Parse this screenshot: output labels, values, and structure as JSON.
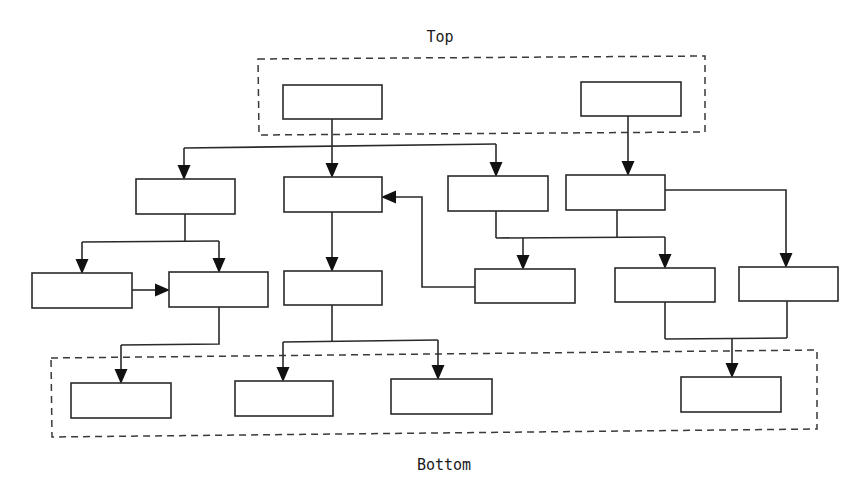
{
  "diagram": {
    "labels": {
      "top": {
        "text": "Top",
        "x": 440,
        "y": 42
      },
      "bottom": {
        "text": "Bottom",
        "x": 444,
        "y": 470
      }
    },
    "colors": {
      "stroke": "#2a2a2a",
      "background": "#ffffff",
      "arrow": "#111111"
    },
    "groups": [
      {
        "id": "top-group",
        "points": "258,59 705,56 705,132 259,135"
      },
      {
        "id": "bottom-group",
        "points": "51,358 817,350 817,429 52,437"
      }
    ],
    "nodes": [
      {
        "id": "top-1",
        "x": 283,
        "y": 85,
        "w": 99,
        "h": 34
      },
      {
        "id": "top-2",
        "x": 581,
        "y": 82,
        "w": 100,
        "h": 34
      },
      {
        "id": "a",
        "x": 136,
        "y": 179,
        "w": 99,
        "h": 35
      },
      {
        "id": "b",
        "x": 284,
        "y": 177,
        "w": 98,
        "h": 35
      },
      {
        "id": "c",
        "x": 448,
        "y": 176,
        "w": 100,
        "h": 35
      },
      {
        "id": "d",
        "x": 566,
        "y": 175,
        "w": 99,
        "h": 35
      },
      {
        "id": "e",
        "x": 32,
        "y": 273,
        "w": 100,
        "h": 35
      },
      {
        "id": "f",
        "x": 169,
        "y": 272,
        "w": 99,
        "h": 35
      },
      {
        "id": "g",
        "x": 284,
        "y": 271,
        "w": 98,
        "h": 34
      },
      {
        "id": "h",
        "x": 475,
        "y": 269,
        "w": 100,
        "h": 34
      },
      {
        "id": "i",
        "x": 615,
        "y": 268,
        "w": 100,
        "h": 34
      },
      {
        "id": "j",
        "x": 739,
        "y": 267,
        "w": 99,
        "h": 34
      },
      {
        "id": "k",
        "x": 71,
        "y": 383,
        "w": 100,
        "h": 35
      },
      {
        "id": "l",
        "x": 235,
        "y": 381,
        "w": 98,
        "h": 35
      },
      {
        "id": "m",
        "x": 391,
        "y": 379,
        "w": 101,
        "h": 35
      },
      {
        "id": "n",
        "x": 681,
        "y": 377,
        "w": 100,
        "h": 35
      }
    ],
    "edges": [
      {
        "id": "top1-trunk",
        "points": "332,119 332,146"
      },
      {
        "id": "top1-branch",
        "points": "184,148 496,144"
      },
      {
        "id": "top1-to-a",
        "points": "184,148 184,165",
        "arrow": true
      },
      {
        "id": "top1-to-b",
        "points": "332,146 332,163",
        "arrow": true
      },
      {
        "id": "top1-to-c",
        "points": "496,144 496,162",
        "arrow": true
      },
      {
        "id": "top2-to-d",
        "points": "628,116 628,161",
        "arrow": true
      },
      {
        "id": "a-trunk",
        "points": "185,214 185,241"
      },
      {
        "id": "a-branch",
        "points": "82,242 219,241"
      },
      {
        "id": "a-to-e",
        "points": "82,242 82,259",
        "arrow": true
      },
      {
        "id": "a-to-f",
        "points": "219,241 219,258",
        "arrow": true
      },
      {
        "id": "e-to-f",
        "points": "132,290 155,290",
        "arrow": true
      },
      {
        "id": "b-to-g",
        "points": "332,212 332,257",
        "arrow": true
      },
      {
        "id": "h-to-b",
        "points": "475,287 422,287 422,197 396,197",
        "arrow": true
      },
      {
        "id": "c-stem",
        "points": "496,211 496,238"
      },
      {
        "id": "d-stem",
        "points": "617,210 617,238"
      },
      {
        "id": "cd-branch",
        "points": "496,238 665,237"
      },
      {
        "id": "cd-to-h",
        "points": "523,238 523,255",
        "arrow": true
      },
      {
        "id": "cd-to-i",
        "points": "665,237 665,254",
        "arrow": true
      },
      {
        "id": "d-to-j",
        "points": "665,190 786,190 786,253",
        "arrow": true
      },
      {
        "id": "f-stem",
        "points": "219,307 219,344 121,345"
      },
      {
        "id": "f-to-k",
        "points": "121,345 121,369",
        "arrow": true
      },
      {
        "id": "g-stem",
        "points": "332,305 332,341"
      },
      {
        "id": "g-branch",
        "points": "283,342 438,340"
      },
      {
        "id": "g-to-l",
        "points": "283,342 283,367",
        "arrow": true
      },
      {
        "id": "g-to-m",
        "points": "438,340 438,365",
        "arrow": true
      },
      {
        "id": "i-stem",
        "points": "665,302 665,339"
      },
      {
        "id": "j-stem",
        "points": "787,301 787,338"
      },
      {
        "id": "ij-branch",
        "points": "665,339 787,338"
      },
      {
        "id": "ij-to-n",
        "points": "732,339 732,363",
        "arrow": true
      }
    ]
  }
}
